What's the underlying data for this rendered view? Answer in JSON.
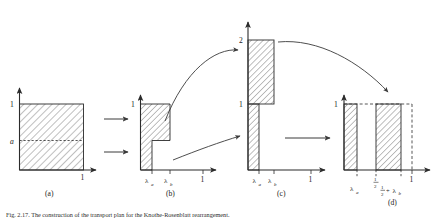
{
  "figure": {
    "caption": "Fig. 2.17. The construction of the transport plan for the Knothe-Rosenblatt rearrangement.",
    "panels": [
      {
        "id": "a",
        "label": "(a)",
        "y_ticks": [
          "1",
          "a"
        ],
        "x_ticks": [
          "1"
        ],
        "description": "unit square fully hatched with dashed horizontal line at height a"
      },
      {
        "id": "b",
        "label": "(b)",
        "y_ticks": [
          "1"
        ],
        "x_ticks": [
          "λₐ",
          "λᵇ",
          "1"
        ],
        "description": "step shaped hatched region: narrow tall column up to lambda_a and block of height 1 to lambda_b"
      },
      {
        "id": "c",
        "label": "(c)",
        "y_ticks": [
          "2",
          "1"
        ],
        "x_ticks": [
          "λₐ",
          "λᵇ",
          "1"
        ],
        "description": "narrow hatched column of height 1 at lambda_a and hatched block from 1 to 2 between lambda_a and lambda_b"
      },
      {
        "id": "d",
        "label": "(d)",
        "y_ticks": [
          "1"
        ],
        "x_ticks": [
          "λₐ",
          "½",
          "½+λᵇ",
          "1"
        ],
        "description": "two hatched bars of height 1: one from 0 to lambda_a, one from one half to one half plus lambda_b, dashed outline to 1"
      }
    ],
    "arrows": [
      {
        "name": "a-to-b-upper",
        "kind": "straight"
      },
      {
        "name": "a-to-b-lower",
        "kind": "straight"
      },
      {
        "name": "b-to-c-upper",
        "kind": "curved"
      },
      {
        "name": "b-to-c-lower",
        "kind": "curved"
      },
      {
        "name": "c-to-d-curved",
        "kind": "curved"
      },
      {
        "name": "c-to-d-straight",
        "kind": "straight"
      }
    ],
    "colors": {
      "ink": "#2b2b2b",
      "hatch": "#555555",
      "background": "#ffffff"
    }
  }
}
